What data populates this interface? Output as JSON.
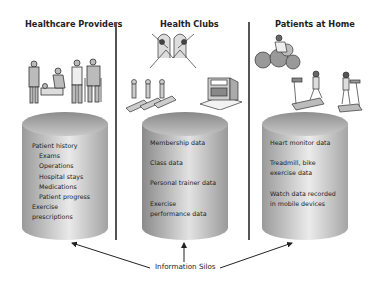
{
  "columns": [
    {
      "title": "Healthcare Providers",
      "illustration": "doctors-nurses-patients-icon",
      "silo_items": [
        {
          "text": "Patient history",
          "indent": false
        },
        {
          "text": "Exams",
          "indent": true
        },
        {
          "text": "Operations",
          "indent": true
        },
        {
          "text": "Hospital stays",
          "indent": true
        },
        {
          "text": "Medications",
          "indent": true
        },
        {
          "text": "Patient progress",
          "indent": true
        },
        {
          "text": "Exercise",
          "indent": false
        },
        {
          "text": "prescriptions",
          "indent": false
        }
      ]
    },
    {
      "title": "Health Clubs",
      "illustration": "gym-class-treadmills-building-icon",
      "silo_items": [
        {
          "text": "Membership data"
        },
        {
          "text": "Class data"
        },
        {
          "text": "Personal trainer data"
        },
        {
          "text": "Exercise"
        },
        {
          "text": "performance data"
        }
      ]
    },
    {
      "title": "Patients at Home",
      "illustration": "exercise-bike-treadmill-users-icon",
      "silo_items": [
        {
          "text": "Heart monitor data"
        },
        {
          "text": "Treadmill, bike"
        },
        {
          "text": "exercise data"
        },
        {
          "text": "Watch data recorded"
        },
        {
          "text": "in mobile devices"
        }
      ]
    }
  ],
  "callout": {
    "label": "Information Silos",
    "arrow_count": 3
  },
  "colors": {
    "cylinder_light": "#e6e6e6",
    "cylinder_dark": "#9a9a9a",
    "divider": "#555555",
    "arrow": "#222222"
  }
}
